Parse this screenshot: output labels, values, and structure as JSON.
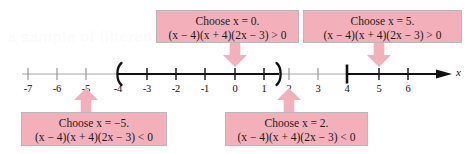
{
  "figure": {
    "type": "number-line-sign-chart",
    "axis_label": "x",
    "ghost_text": "a sample of filtered",
    "tick_labels": [
      "-7",
      "-6",
      "-5",
      "-4",
      "-3",
      "-2",
      "-1",
      "0",
      "1",
      "2",
      "3",
      "4",
      "5",
      "6"
    ],
    "tick_values": [
      -7,
      -6,
      -5,
      -4,
      -3,
      -2,
      -1,
      0,
      1,
      2,
      3,
      4,
      5,
      6
    ],
    "bracket_open_at": -4,
    "bracket_close_at": 1.5,
    "solution_intervals": [
      {
        "from": -4,
        "to": 1.5,
        "open_symbol": "(",
        "close_symbol": ")"
      },
      {
        "from": 4,
        "to": 6.6,
        "open_symbol": "|",
        "close_symbol": ""
      }
    ],
    "colors": {
      "callout_fill": "#f3b0ba",
      "callout_border": "#b9b9b9",
      "axis": "#9a9a9a",
      "axis_bold": "#111111",
      "text": "#1b1b1b"
    }
  },
  "callouts": [
    {
      "id": "choose-x-0",
      "line1": "Choose x = 0.",
      "line2": "(x − 4)(x + 4)(2x − 3) > 0",
      "points_to": 0,
      "arrow_direction": "down"
    },
    {
      "id": "choose-x-5",
      "line1": "Choose x = 5.",
      "line2": "(x − 4)(x + 4)(2x − 3) > 0",
      "points_to": 5,
      "arrow_direction": "down"
    },
    {
      "id": "choose-x-neg5",
      "line1": "Choose x = −5.",
      "line2": "(x − 4)(x + 4)(2x − 3) < 0",
      "points_to": -5,
      "arrow_direction": "up"
    },
    {
      "id": "choose-x-2",
      "line1": "Choose x = 2.",
      "line2": "(x − 4)(x + 4)(2x − 3) < 0",
      "points_to": 2,
      "arrow_direction": "up"
    }
  ]
}
